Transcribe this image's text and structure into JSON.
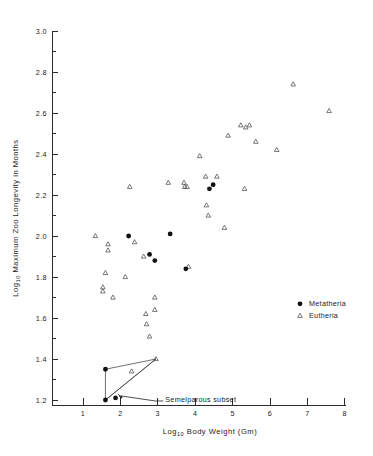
{
  "chart_data": {
    "type": "scatter",
    "title": "",
    "xlabel": "Log10 Body Weight (Gm)",
    "ylabel": "Log10 Maximum Zoo Longevity in Months",
    "xlabel_main": "Body  Weight  (Gm)",
    "ylabel_main": "Maximum Zoo Longevity in Months",
    "log_prefix": "Log",
    "log_subscript": "10",
    "xlim": [
      0.35,
      8.3
    ],
    "ylim": [
      1.05,
      3.05
    ],
    "xticks": [
      1,
      2,
      3,
      4,
      5,
      6,
      7,
      8
    ],
    "xticklabels": [
      "1",
      "2",
      "3",
      "4",
      "5",
      "6",
      "7",
      "8"
    ],
    "yticks": [
      1.2,
      1.4,
      1.6,
      1.8,
      2.0,
      2.2,
      2.4,
      2.6,
      2.8,
      3.0
    ],
    "yticklabels": [
      "1.2",
      "1.4",
      "1.6",
      "1.8",
      "2.0",
      "2.2",
      "2.4",
      "2.6",
      "2.8",
      "3.0"
    ],
    "yminorticks": [
      1.1,
      1.3,
      1.5,
      1.7,
      1.9,
      2.1,
      2.3,
      2.5,
      2.7,
      2.9
    ],
    "grid": false,
    "legend_position": "right-middle",
    "series": [
      {
        "name": "Metatheria",
        "marker": "filled-circle",
        "color": "#111111",
        "points": [
          [
            2.22,
            2.0
          ],
          [
            3.33,
            2.01
          ],
          [
            2.78,
            1.91
          ],
          [
            2.92,
            1.88
          ],
          [
            3.75,
            1.84
          ],
          [
            4.38,
            2.23
          ],
          [
            4.48,
            2.25
          ],
          [
            1.6,
            1.35
          ],
          [
            1.6,
            1.2
          ],
          [
            1.87,
            1.21
          ]
        ]
      },
      {
        "name": "Eutheria",
        "marker": "open-triangle",
        "color": "#555555",
        "points": [
          [
            1.33,
            2.0
          ],
          [
            1.67,
            1.96
          ],
          [
            1.67,
            1.93
          ],
          [
            1.6,
            1.82
          ],
          [
            1.53,
            1.75
          ],
          [
            1.53,
            1.73
          ],
          [
            1.8,
            1.7
          ],
          [
            2.13,
            1.8
          ],
          [
            2.25,
            2.24
          ],
          [
            2.38,
            1.97
          ],
          [
            2.62,
            1.9
          ],
          [
            2.68,
            1.62
          ],
          [
            2.7,
            1.57
          ],
          [
            2.78,
            1.51
          ],
          [
            2.92,
            1.7
          ],
          [
            2.92,
            1.64
          ],
          [
            3.28,
            2.26
          ],
          [
            3.7,
            2.26
          ],
          [
            3.72,
            2.24
          ],
          [
            3.78,
            2.24
          ],
          [
            3.82,
            1.85
          ],
          [
            4.12,
            2.39
          ],
          [
            4.28,
            2.29
          ],
          [
            4.3,
            2.15
          ],
          [
            4.35,
            2.1
          ],
          [
            4.58,
            2.29
          ],
          [
            4.78,
            2.04
          ],
          [
            4.88,
            2.49
          ],
          [
            5.22,
            2.54
          ],
          [
            5.35,
            2.53
          ],
          [
            5.32,
            2.23
          ],
          [
            5.45,
            2.54
          ],
          [
            5.62,
            2.46
          ],
          [
            6.18,
            2.42
          ],
          [
            6.62,
            2.74
          ],
          [
            7.58,
            2.61
          ],
          [
            2.3,
            1.34
          ],
          [
            2.95,
            1.4
          ]
        ]
      }
    ],
    "annotations": [
      {
        "text": "Semelparous subset",
        "name": "semelparous-subset-label",
        "x": 3.2,
        "y": 1.205
      }
    ],
    "hull": {
      "name": "semelparous-subset-hull",
      "vertices": [
        [
          1.6,
          1.35
        ],
        [
          2.95,
          1.4
        ],
        [
          1.6,
          1.2
        ]
      ]
    }
  },
  "legend": {
    "items": [
      {
        "label": "Metatheria",
        "marker": "filled-circle"
      },
      {
        "label": "Eutheria",
        "marker": "open-triangle"
      }
    ]
  }
}
